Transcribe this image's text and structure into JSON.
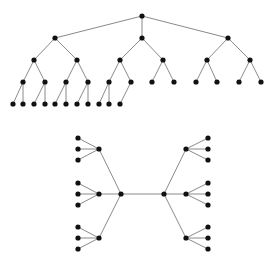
{
  "diagram": {
    "title": "",
    "colors": {
      "node": "#111111",
      "edge": "#8a8a8a",
      "background": "#ffffff"
    },
    "node_radius": 2.6,
    "trees": [
      {
        "name": "top-rooted-tree",
        "nodes": [
          {
            "id": "r",
            "x": 142,
            "y": 16
          },
          {
            "id": "a",
            "x": 55,
            "y": 38
          },
          {
            "id": "b",
            "x": 142,
            "y": 38
          },
          {
            "id": "c",
            "x": 228,
            "y": 38
          },
          {
            "id": "a1",
            "x": 34,
            "y": 60
          },
          {
            "id": "a2",
            "x": 77,
            "y": 60
          },
          {
            "id": "b1",
            "x": 120,
            "y": 60
          },
          {
            "id": "b2",
            "x": 163,
            "y": 60
          },
          {
            "id": "c1",
            "x": 207,
            "y": 60
          },
          {
            "id": "c2",
            "x": 250,
            "y": 60
          },
          {
            "id": "a1a",
            "x": 23,
            "y": 82
          },
          {
            "id": "a1b",
            "x": 45,
            "y": 82
          },
          {
            "id": "a2a",
            "x": 66,
            "y": 82
          },
          {
            "id": "a2b",
            "x": 88,
            "y": 82
          },
          {
            "id": "b1a",
            "x": 109,
            "y": 82
          },
          {
            "id": "b1b",
            "x": 131,
            "y": 82
          },
          {
            "id": "b2a",
            "x": 152,
            "y": 82
          },
          {
            "id": "b2b",
            "x": 174,
            "y": 82
          },
          {
            "id": "c1a",
            "x": 196,
            "y": 82
          },
          {
            "id": "c1b",
            "x": 217,
            "y": 82
          },
          {
            "id": "c2a",
            "x": 239,
            "y": 82
          },
          {
            "id": "c2b",
            "x": 261,
            "y": 82
          },
          {
            "id": "l1",
            "x": 13,
            "y": 104
          },
          {
            "id": "l2",
            "x": 23,
            "y": 104
          },
          {
            "id": "l3",
            "x": 34,
            "y": 104
          },
          {
            "id": "l4",
            "x": 45,
            "y": 104
          },
          {
            "id": "l5",
            "x": 55,
            "y": 104
          },
          {
            "id": "l6",
            "x": 66,
            "y": 104
          },
          {
            "id": "l7",
            "x": 77,
            "y": 104
          },
          {
            "id": "l8",
            "x": 88,
            "y": 104
          },
          {
            "id": "l9",
            "x": 99,
            "y": 104
          },
          {
            "id": "l10",
            "x": 109,
            "y": 104
          },
          {
            "id": "l11",
            "x": 120,
            "y": 104
          }
        ],
        "edges": [
          [
            "r",
            "a"
          ],
          [
            "r",
            "b"
          ],
          [
            "r",
            "c"
          ],
          [
            "a",
            "a1"
          ],
          [
            "a",
            "a2"
          ],
          [
            "b",
            "b1"
          ],
          [
            "b",
            "b2"
          ],
          [
            "c",
            "c1"
          ],
          [
            "c",
            "c2"
          ],
          [
            "a1",
            "a1a"
          ],
          [
            "a1",
            "a1b"
          ],
          [
            "a2",
            "a2a"
          ],
          [
            "a2",
            "a2b"
          ],
          [
            "b1",
            "b1a"
          ],
          [
            "b1",
            "b1b"
          ],
          [
            "b2",
            "b2a"
          ],
          [
            "b2",
            "b2b"
          ],
          [
            "c1",
            "c1a"
          ],
          [
            "c1",
            "c1b"
          ],
          [
            "c2",
            "c2a"
          ],
          [
            "c2",
            "c2b"
          ],
          [
            "a1a",
            "l1"
          ],
          [
            "a1a",
            "l2"
          ],
          [
            "a1b",
            "l3"
          ],
          [
            "a1b",
            "l4"
          ],
          [
            "a2a",
            "l5"
          ],
          [
            "a2a",
            "l6"
          ],
          [
            "a2b",
            "l7"
          ],
          [
            "a2b",
            "l8"
          ],
          [
            "b1a",
            "l9"
          ],
          [
            "b1a",
            "l10"
          ],
          [
            "b1b",
            "l11"
          ]
        ]
      },
      {
        "name": "bottom-symmetric-tree",
        "nodes": [
          {
            "id": "L",
            "x": 121,
            "y": 194
          },
          {
            "id": "R",
            "x": 164,
            "y": 194
          },
          {
            "id": "L1",
            "x": 99,
            "y": 149
          },
          {
            "id": "L2",
            "x": 99,
            "y": 194
          },
          {
            "id": "L3",
            "x": 99,
            "y": 238
          },
          {
            "id": "R1",
            "x": 186,
            "y": 149
          },
          {
            "id": "R2",
            "x": 186,
            "y": 194
          },
          {
            "id": "R3",
            "x": 186,
            "y": 238
          },
          {
            "id": "L1a",
            "x": 78,
            "y": 138
          },
          {
            "id": "L1b",
            "x": 78,
            "y": 149
          },
          {
            "id": "L1c",
            "x": 78,
            "y": 160
          },
          {
            "id": "L2a",
            "x": 78,
            "y": 183
          },
          {
            "id": "L2b",
            "x": 78,
            "y": 194
          },
          {
            "id": "L2c",
            "x": 78,
            "y": 205
          },
          {
            "id": "L3a",
            "x": 78,
            "y": 227
          },
          {
            "id": "L3b",
            "x": 78,
            "y": 238
          },
          {
            "id": "L3c",
            "x": 78,
            "y": 249
          },
          {
            "id": "R1a",
            "x": 208,
            "y": 138
          },
          {
            "id": "R1b",
            "x": 208,
            "y": 149
          },
          {
            "id": "R1c",
            "x": 208,
            "y": 160
          },
          {
            "id": "R2a",
            "x": 208,
            "y": 183
          },
          {
            "id": "R2b",
            "x": 208,
            "y": 194
          },
          {
            "id": "R2c",
            "x": 208,
            "y": 205
          },
          {
            "id": "R3a",
            "x": 208,
            "y": 227
          },
          {
            "id": "R3b",
            "x": 208,
            "y": 238
          },
          {
            "id": "R3c",
            "x": 208,
            "y": 249
          }
        ],
        "edges": [
          [
            "L",
            "R"
          ],
          [
            "L",
            "L1"
          ],
          [
            "L",
            "L2"
          ],
          [
            "L",
            "L3"
          ],
          [
            "R",
            "R1"
          ],
          [
            "R",
            "R2"
          ],
          [
            "R",
            "R3"
          ],
          [
            "L1",
            "L1a"
          ],
          [
            "L1",
            "L1b"
          ],
          [
            "L1",
            "L1c"
          ],
          [
            "L2",
            "L2a"
          ],
          [
            "L2",
            "L2b"
          ],
          [
            "L2",
            "L2c"
          ],
          [
            "L3",
            "L3a"
          ],
          [
            "L3",
            "L3b"
          ],
          [
            "L3",
            "L3c"
          ],
          [
            "R1",
            "R1a"
          ],
          [
            "R1",
            "R1b"
          ],
          [
            "R1",
            "R1c"
          ],
          [
            "R2",
            "R2a"
          ],
          [
            "R2",
            "R2b"
          ],
          [
            "R2",
            "R2c"
          ],
          [
            "R3",
            "R3a"
          ],
          [
            "R3",
            "R3b"
          ],
          [
            "R3",
            "R3c"
          ]
        ]
      }
    ]
  }
}
